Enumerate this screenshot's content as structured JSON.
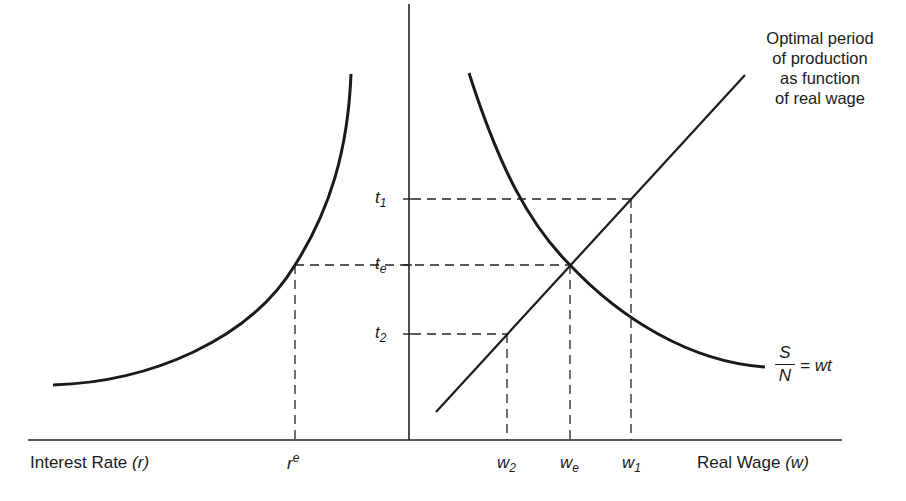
{
  "diagram": {
    "annotation": {
      "lines": [
        "Optimal period",
        "of production",
        "as function",
        "of real wage"
      ]
    },
    "axes": {
      "left_label": "Interest Rate",
      "left_symbol": "(r)",
      "right_label": "Real Wage",
      "right_symbol": "(w)"
    },
    "y_ticks": [
      {
        "base": "t",
        "sub": "1"
      },
      {
        "base": "t",
        "sub": "e"
      },
      {
        "base": "t",
        "sub": "2"
      }
    ],
    "x_ticks_left": [
      {
        "base": "r",
        "sup": "e"
      }
    ],
    "x_ticks_right": [
      {
        "base": "w",
        "sub": "2"
      },
      {
        "base": "w",
        "sub": "e"
      },
      {
        "base": "w",
        "sub": "1"
      }
    ],
    "curve_label": {
      "numerator": "S",
      "denominator": "N",
      "rhs": "= wt"
    }
  }
}
